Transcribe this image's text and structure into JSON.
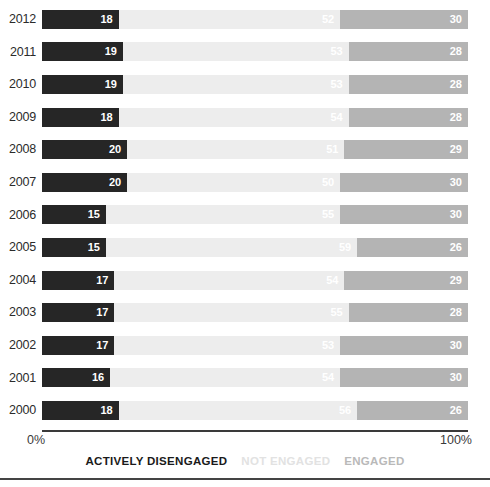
{
  "chart_data": {
    "type": "bar",
    "subtype": "horizontal-stacked-100-percent",
    "title": "",
    "xlabel": "",
    "ylabel": "",
    "xlim": [
      0,
      100
    ],
    "grid": false,
    "legend_position": "bottom-center",
    "orientation": "horizontal",
    "stacked": true,
    "categories": [
      "2012",
      "2011",
      "2010",
      "2009",
      "2008",
      "2007",
      "2006",
      "2005",
      "2004",
      "2003",
      "2002",
      "2001",
      "2000"
    ],
    "series": [
      {
        "name": "ACTIVELY DISENGAGED",
        "color": "#262626",
        "label_color": "#ffffff",
        "values": [
          18,
          19,
          19,
          18,
          20,
          20,
          15,
          15,
          17,
          17,
          17,
          16,
          18
        ]
      },
      {
        "name": "NOT ENGAGED",
        "color": "#ededed",
        "label_color": "#ffffff",
        "values": [
          52,
          53,
          53,
          54,
          51,
          50,
          55,
          59,
          54,
          55,
          53,
          54,
          56
        ]
      },
      {
        "name": "ENGAGED",
        "color": "#b4b4b4",
        "label_color": "#ffffff",
        "values": [
          30,
          28,
          28,
          28,
          29,
          30,
          30,
          26,
          29,
          28,
          30,
          30,
          26
        ]
      }
    ],
    "rows": [
      {
        "year": "2012",
        "actively_disengaged": 18,
        "not_engaged": 52,
        "engaged": 30
      },
      {
        "year": "2011",
        "actively_disengaged": 19,
        "not_engaged": 53,
        "engaged": 28
      },
      {
        "year": "2010",
        "actively_disengaged": 19,
        "not_engaged": 53,
        "engaged": 28
      },
      {
        "year": "2009",
        "actively_disengaged": 18,
        "not_engaged": 54,
        "engaged": 28
      },
      {
        "year": "2008",
        "actively_disengaged": 20,
        "not_engaged": 51,
        "engaged": 29
      },
      {
        "year": "2007",
        "actively_disengaged": 20,
        "not_engaged": 50,
        "engaged": 30
      },
      {
        "year": "2006",
        "actively_disengaged": 15,
        "not_engaged": 55,
        "engaged": 30
      },
      {
        "year": "2005",
        "actively_disengaged": 15,
        "not_engaged": 59,
        "engaged": 26
      },
      {
        "year": "2004",
        "actively_disengaged": 17,
        "not_engaged": 54,
        "engaged": 29
      },
      {
        "year": "2003",
        "actively_disengaged": 17,
        "not_engaged": 55,
        "engaged": 28
      },
      {
        "year": "2002",
        "actively_disengaged": 17,
        "not_engaged": 53,
        "engaged": 30
      },
      {
        "year": "2001",
        "actively_disengaged": 16,
        "not_engaged": 54,
        "engaged": 30
      },
      {
        "year": "2000",
        "actively_disengaged": 18,
        "not_engaged": 56,
        "engaged": 26
      }
    ]
  },
  "axis": {
    "min_label": "0%",
    "max_label": "100%"
  },
  "legend": {
    "items": [
      {
        "label": "ACTIVELY DISENGAGED"
      },
      {
        "label": "NOT ENGAGED"
      },
      {
        "label": "ENGAGED"
      }
    ]
  },
  "colors": {
    "actively_disengaged": "#262626",
    "not_engaged": "#ededed",
    "engaged": "#b4b4b4",
    "axis": "#3a3a3a",
    "background": "#ffffff"
  }
}
